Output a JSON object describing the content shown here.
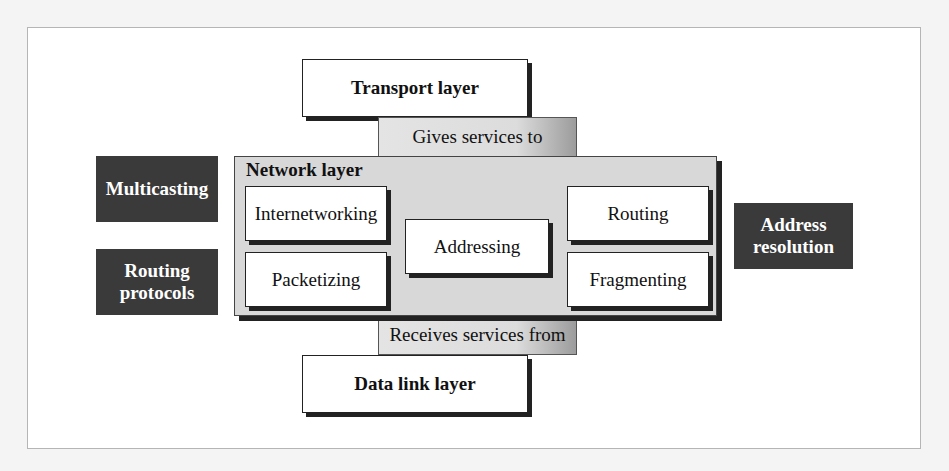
{
  "diagram": {
    "transport": "Transport layer",
    "gives": "Gives services to",
    "network": "Network layer",
    "internetworking": "Internetworking",
    "packetizing": "Packetizing",
    "addressing": "Addressing",
    "routing": "Routing",
    "fragmenting": "Fragmenting",
    "receives": "Receives services from",
    "datalink": "Data link layer",
    "multicasting": "Multicasting",
    "routing_protocols_1": "Routing",
    "routing_protocols_2": "protocols",
    "address_resolution_1": "Address",
    "address_resolution_2": "resolution"
  },
  "colors": {
    "dark_box": "#3a3a3a",
    "network_fill": "#d8d8d8",
    "frame_border": "#b5b5b5"
  }
}
